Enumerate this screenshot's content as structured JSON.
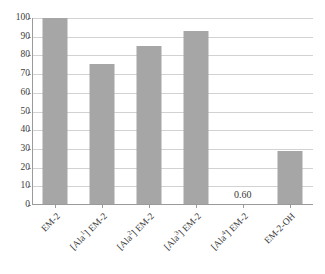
{
  "chart_data": {
    "type": "bar",
    "title": "",
    "subtitle": "",
    "xlabel": "",
    "ylabel": "",
    "ylim": [
      0,
      100
    ],
    "ytick_step": 10,
    "grid": true,
    "legend": false,
    "bar_color": "#a6a6a6",
    "gridline_color": "#d2d2d2",
    "axis_color": "#9a9a9a",
    "categories": [
      "EM-2",
      "[Ala1] EM-2",
      "[Ala2] EM-2",
      "[Ala3] EM-2",
      "[Ala4] EM-2",
      "EM-2-OH"
    ],
    "category_parts": [
      {
        "pre": "EM-2",
        "sup": "",
        "post": ""
      },
      {
        "pre": "[Ala",
        "sup": "1",
        "post": "] EM-2"
      },
      {
        "pre": "[Ala",
        "sup": "2",
        "post": "] EM-2"
      },
      {
        "pre": "[Ala",
        "sup": "3",
        "post": "] EM-2"
      },
      {
        "pre": "[Ala",
        "sup": "4",
        "post": "] EM-2"
      },
      {
        "pre": "EM-2-OH",
        "sup": "",
        "post": ""
      }
    ],
    "values": [
      100,
      75.5,
      85,
      93,
      0.6,
      29
    ],
    "data_labels": [
      "",
      "",
      "",
      "",
      "0.60",
      ""
    ],
    "ytick_labels": [
      "0",
      "10",
      "20",
      "30",
      "40",
      "50",
      "60",
      "70",
      "80",
      "90",
      "100"
    ],
    "ytick_values": [
      0,
      10,
      20,
      30,
      40,
      50,
      60,
      70,
      80,
      90,
      100
    ]
  }
}
